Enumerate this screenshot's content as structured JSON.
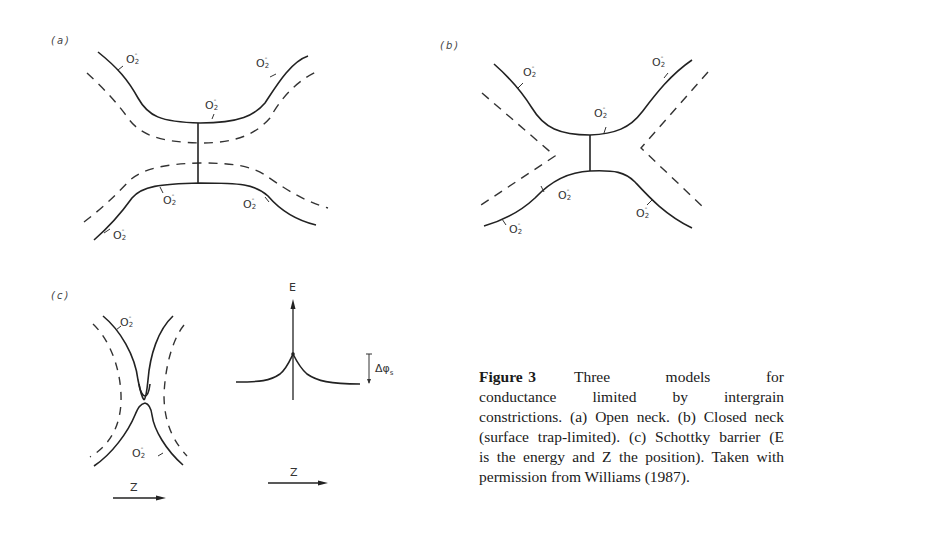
{
  "figure": {
    "number_label": "Figure 3",
    "caption_lines": [
      "Three models for",
      "conductance limited by intergrain",
      "constrictions. (a) Open neck. (b) Closed neck",
      "(surface trap-limited). (c) Schottky barrier (E",
      "is the energy and Z the position).  Taken with",
      "permission from Williams (1987)."
    ],
    "caption_full": "Three models for conductance limited by intergrain constrictions. (a) Open neck. (b) Closed neck (surface trap-limited). (c) Schottky barrier (E is the energy and Z the position). Taken with permission from Williams (1987)."
  },
  "panels": {
    "a": {
      "label": "(a)",
      "title": "Open neck",
      "species_label": "O",
      "species_sub": "2",
      "species_sup": "-",
      "species_count": 6
    },
    "b": {
      "label": "(b)",
      "title": "Closed neck (surface trap-limited)",
      "species_label": "O",
      "species_sub": "2",
      "species_sup": "-",
      "species_count": 6
    },
    "c": {
      "label": "(c)",
      "title": "Schottky barrier",
      "species_label": "O",
      "species_sub": "2",
      "species_sup": "-",
      "species_count": 2,
      "z_axis_label": "Z",
      "energy_axis_label": "E",
      "barrier_label": "Δφ",
      "barrier_sub": "s",
      "energy_z_axis_label": "Z"
    }
  }
}
